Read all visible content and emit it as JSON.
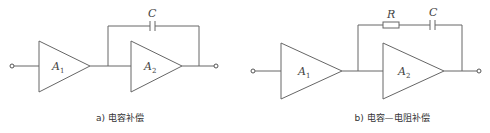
{
  "panels": [
    {
      "id": "a",
      "caption": "a) 电容补偿",
      "amplifiers": [
        {
          "name": "A",
          "sub": "1"
        },
        {
          "name": "A",
          "sub": "2"
        }
      ],
      "feedback": {
        "components": [
          {
            "type": "capacitor",
            "label": "C"
          }
        ]
      }
    },
    {
      "id": "b",
      "caption": "b) 电容—电阻补偿",
      "amplifiers": [
        {
          "name": "A",
          "sub": "1"
        },
        {
          "name": "A",
          "sub": "2"
        }
      ],
      "feedback": {
        "components": [
          {
            "type": "resistor",
            "label": "R"
          },
          {
            "type": "capacitor",
            "label": "C"
          }
        ]
      }
    }
  ],
  "colors": {
    "line": "#666666",
    "text": "#444444",
    "background": "#ffffff"
  }
}
